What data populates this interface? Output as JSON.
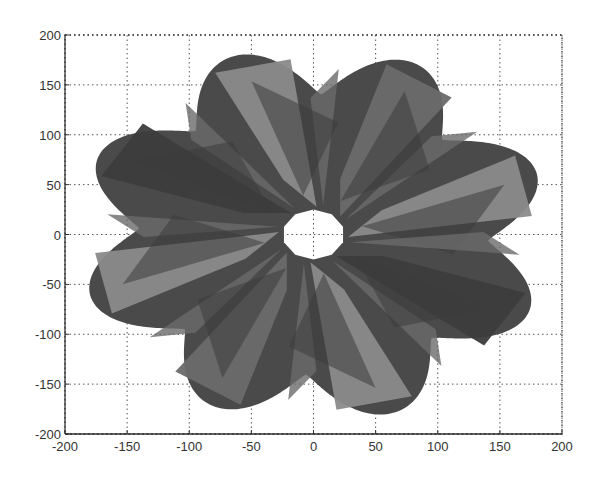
{
  "chart_data": {
    "type": "surface-projection",
    "title": "",
    "xlabel": "",
    "ylabel": "",
    "xlim": [
      -200,
      200
    ],
    "ylim": [
      -200,
      200
    ],
    "grid": true,
    "x_ticks": [
      -200,
      -150,
      -100,
      -50,
      0,
      50,
      100,
      150,
      200
    ],
    "y_ticks": [
      -200,
      -150,
      -100,
      -50,
      0,
      50,
      100,
      150,
      200
    ],
    "x_tick_labels": [
      "-200",
      "-150",
      "-100",
      "-50",
      "0",
      "50",
      "100",
      "150",
      "200"
    ],
    "y_tick_labels": [
      "200",
      "150",
      "100",
      "50",
      "0",
      "-50",
      "-100",
      "-150",
      "-200"
    ],
    "shape": {
      "petal_count": 8,
      "center": [
        0,
        0
      ],
      "inner_hole_radius": 25,
      "outer_radius_approx": 190,
      "petal_tip_directions_deg": [
        20,
        65,
        110,
        155,
        200,
        245,
        290,
        335
      ]
    },
    "colors": {
      "outer": "#4a4a4a",
      "facet_light": "#8a8a8a",
      "facet_mid": "#6a6a6a",
      "facet_dark": "#3c3c3c",
      "hole": "#ffffff"
    }
  }
}
